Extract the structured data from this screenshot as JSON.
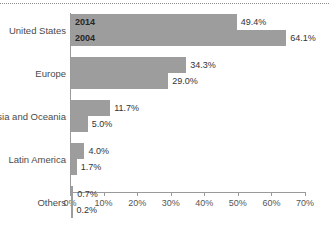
{
  "chart_data": {
    "type": "bar",
    "orientation": "horizontal",
    "title": "",
    "subtitle": "",
    "xlabel": "",
    "ylabel": "",
    "xlim": [
      0,
      70
    ],
    "xtick_labels": [
      "0%",
      "10%",
      "20%",
      "30%",
      "40%",
      "50%",
      "60%",
      "70%"
    ],
    "xticks": [
      0,
      10,
      20,
      30,
      40,
      50,
      60,
      70
    ],
    "grid": false,
    "legend_position": "in-bar",
    "categories": [
      "United States",
      "Europe",
      "Asia and Oceania",
      "Latin America",
      "Others"
    ],
    "series": [
      {
        "name": "2014",
        "values": [
          49.4,
          34.3,
          11.7,
          4.0,
          0.7
        ],
        "value_labels": [
          "49.4%",
          "34.3%",
          "11.7%",
          "4.0%",
          "0.7%"
        ]
      },
      {
        "name": "2004",
        "values": [
          64.1,
          29.0,
          5.0,
          1.7,
          0.2
        ],
        "value_labels": [
          "64.1%",
          "29.0%",
          "5.0%",
          "1.7%",
          "0.2%"
        ]
      }
    ],
    "bar_color": "#9d9d9d",
    "axis_color": "#9a9a9a",
    "text_color": "#4a4a4a"
  }
}
